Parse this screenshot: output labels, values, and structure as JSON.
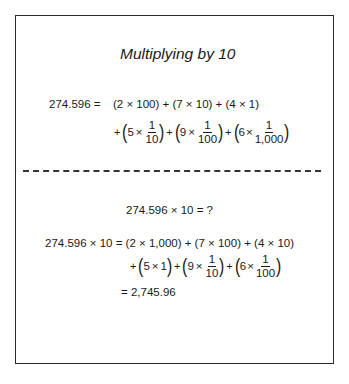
{
  "title": "Multiplying by 10",
  "part1": {
    "lhs": "274.596 =",
    "line1": "(2 × 100) + (7 × 10) + (4 × 1)",
    "line2": {
      "plus": "+",
      "terms": [
        {
          "coef": "5",
          "times": "×",
          "num": "1",
          "den": "10"
        },
        {
          "coef": "9",
          "times": "×",
          "num": "1",
          "den": "100"
        },
        {
          "coef": "6",
          "times": "×",
          "num": "1",
          "den": "1,000"
        }
      ]
    }
  },
  "part2": {
    "question": "274.596 × 10 = ?",
    "line1": "274.596 × 10 = (2 × 1,000) + (7 × 100) + (4 × 10)",
    "line2": {
      "plus": "+",
      "term0": {
        "coef": "5",
        "times": "×",
        "value": "1"
      },
      "terms": [
        {
          "coef": "9",
          "times": "×",
          "num": "1",
          "den": "10"
        },
        {
          "coef": "6",
          "times": "×",
          "num": "1",
          "den": "100"
        }
      ]
    },
    "result": "= 2,745.96"
  },
  "colors": {
    "ink": "#1a1a1a",
    "border": "#2a2a2a",
    "background": "#ffffff"
  }
}
